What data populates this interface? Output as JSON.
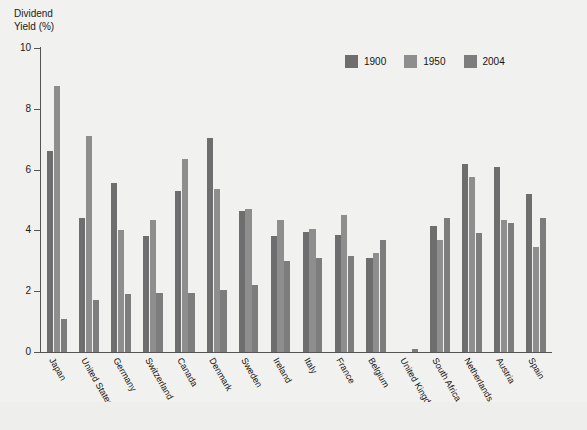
{
  "axis_title_text": "Dividend\nYield (%)",
  "legend": {
    "items": [
      {
        "label": "1900",
        "color": "#6e6e6e"
      },
      {
        "label": "1950",
        "color": "#8e8e8e"
      },
      {
        "label": "2004",
        "color": "#7d7d7d"
      }
    ]
  },
  "chart_data": {
    "type": "bar",
    "title": "",
    "subtitle": "",
    "xlabel": "",
    "ylabel": "Dividend Yield (%)",
    "ylim": [
      0,
      10
    ],
    "yticks": [
      0,
      2,
      4,
      6,
      8,
      10
    ],
    "ytick_labels": [
      "0",
      "2",
      "4",
      "6",
      "8",
      "10"
    ],
    "grid": false,
    "legend_position": "top-right",
    "categories": [
      "Japan",
      "United States",
      "Germany",
      "Switzerland",
      "Canada",
      "Denmark",
      "Sweden",
      "Ireland",
      "Italy",
      "France",
      "Belgium",
      "United Kingdom",
      "South Africa",
      "Netherlands",
      "Austria",
      "Spain"
    ],
    "series": [
      {
        "name": "1900",
        "color": "#6e6e6e",
        "values": [
          6.6,
          4.4,
          5.55,
          3.8,
          5.3,
          7.05,
          4.65,
          3.8,
          3.95,
          3.85,
          3.1,
          0.0,
          4.15,
          6.2,
          6.1,
          5.2
        ]
      },
      {
        "name": "1950",
        "color": "#8e8e8e",
        "values": [
          8.75,
          7.1,
          4.0,
          4.35,
          6.35,
          5.35,
          4.7,
          4.35,
          4.05,
          4.5,
          3.25,
          0.0,
          3.7,
          5.75,
          4.35,
          3.45
        ]
      },
      {
        "name": "2004",
        "color": "#7d7d7d",
        "values": [
          1.1,
          1.7,
          1.9,
          1.95,
          1.95,
          2.05,
          2.2,
          3.0,
          3.1,
          3.15,
          3.7,
          0.1,
          4.4,
          3.9,
          4.25,
          4.4
        ]
      }
    ]
  }
}
